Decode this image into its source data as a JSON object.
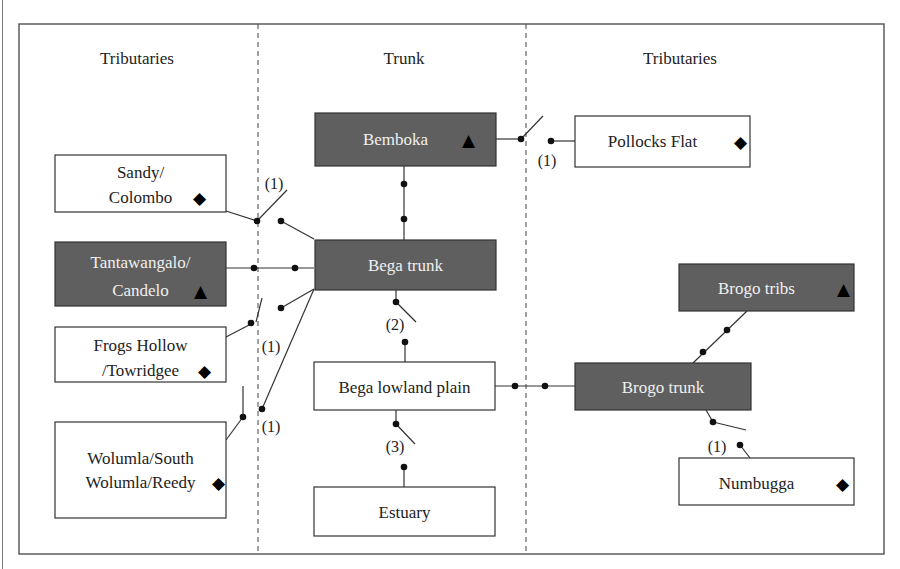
{
  "figure": {
    "top_caption_fragment": "...gy...",
    "column_headers": [
      "Tributaries",
      "Trunk",
      "Tributaries"
    ]
  },
  "colors": {
    "dark_fill": "#5f5f5f",
    "light_fill": "#ffffff",
    "dark_text": "#f0f0f0",
    "light_text": "#222222",
    "line": "#333333"
  },
  "legend_symbols": {
    "triangle": "▲",
    "diamond": "◆"
  },
  "nodes": [
    {
      "id": "bemboka",
      "lines": [
        "Bemboka"
      ],
      "symbol": "▲",
      "style": "dark",
      "column": "trunk"
    },
    {
      "id": "pollocks-flat",
      "lines": [
        "Pollocks Flat"
      ],
      "symbol": "◆",
      "style": "light",
      "column": "right-tributaries"
    },
    {
      "id": "sandy-colombo",
      "lines": [
        "Sandy/",
        "Colombo"
      ],
      "symbol": "◆",
      "style": "light",
      "column": "left-tributaries"
    },
    {
      "id": "tantawangalo-candelo",
      "lines": [
        "Tantawangalo/",
        "Candelo"
      ],
      "symbol": "▲",
      "style": "dark",
      "column": "left-tributaries"
    },
    {
      "id": "bega-trunk",
      "lines": [
        "Bega trunk"
      ],
      "symbol": "",
      "style": "dark",
      "column": "trunk"
    },
    {
      "id": "frogs-hollow",
      "lines": [
        "Frogs Hollow",
        "/Towridgee"
      ],
      "symbol": "◆",
      "style": "light",
      "column": "left-tributaries"
    },
    {
      "id": "wolumla",
      "lines": [
        "Wolumla/South",
        "Wolumla/Reedy"
      ],
      "symbol": "◆",
      "style": "light",
      "column": "left-tributaries"
    },
    {
      "id": "bega-lowland-plain",
      "lines": [
        "Bega lowland plain"
      ],
      "symbol": "",
      "style": "light",
      "column": "trunk"
    },
    {
      "id": "estuary",
      "lines": [
        "Estuary"
      ],
      "symbol": "",
      "style": "light",
      "column": "trunk"
    },
    {
      "id": "brogo-tribs",
      "lines": [
        "Brogo tribs"
      ],
      "symbol": "▲",
      "style": "dark",
      "column": "right-tributaries"
    },
    {
      "id": "brogo-trunk",
      "lines": [
        "Brogo trunk"
      ],
      "symbol": "",
      "style": "dark",
      "column": "right-tributaries"
    },
    {
      "id": "numbugga",
      "lines": [
        "Numbugga"
      ],
      "symbol": "◆",
      "style": "light",
      "column": "right-tributaries"
    }
  ],
  "connections": [
    {
      "from": "bemboka",
      "to": "pollocks-flat",
      "switch": "open",
      "label": "(1)"
    },
    {
      "from": "bemboka",
      "to": "bega-trunk",
      "switch": "closed",
      "label": ""
    },
    {
      "from": "sandy-colombo",
      "to": "bega-trunk",
      "switch": "open",
      "label": "(1)"
    },
    {
      "from": "tantawangalo-candelo",
      "to": "bega-trunk",
      "switch": "closed",
      "label": ""
    },
    {
      "from": "frogs-hollow",
      "to": "bega-trunk",
      "switch": "open",
      "label": "(1)"
    },
    {
      "from": "wolumla",
      "to": "bega-trunk",
      "switch": "open",
      "label": "(1)"
    },
    {
      "from": "bega-trunk",
      "to": "bega-lowland-plain",
      "switch": "open",
      "label": "(2)"
    },
    {
      "from": "bega-lowland-plain",
      "to": "estuary",
      "switch": "open",
      "label": "(3)"
    },
    {
      "from": "bega-lowland-plain",
      "to": "brogo-trunk",
      "switch": "closed",
      "label": ""
    },
    {
      "from": "brogo-tribs",
      "to": "brogo-trunk",
      "switch": "closed",
      "label": ""
    },
    {
      "from": "brogo-trunk",
      "to": "numbugga",
      "switch": "open",
      "label": "(1)"
    }
  ]
}
